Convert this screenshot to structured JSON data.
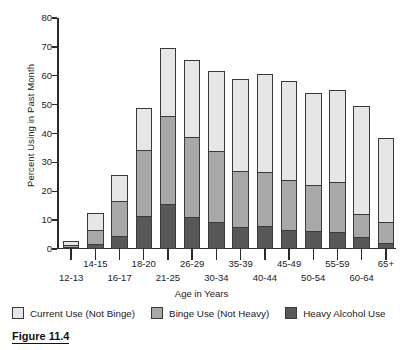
{
  "caption": "Figure 11.4",
  "chart_data": {
    "type": "bar",
    "stacked": true,
    "title": "",
    "xlabel": "Age in Years",
    "ylabel": "Percent Using in Past Month",
    "ylim": [
      0,
      80
    ],
    "yticks": [
      0,
      10,
      20,
      30,
      40,
      50,
      60,
      70,
      80
    ],
    "grid": false,
    "legend_position": "bottom",
    "categories": [
      "12-13",
      "14-15",
      "16-17",
      "18-20",
      "21-25",
      "26-29",
      "30-34",
      "35-39",
      "40-44",
      "45-49",
      "50-54",
      "55-59",
      "60-64",
      "65+"
    ],
    "series": [
      {
        "name": "Heavy Alcohol Use",
        "color": "#585858",
        "values": [
          0.6,
          1.7,
          4.5,
          11.3,
          15.5,
          11.0,
          9.5,
          7.5,
          7.8,
          6.7,
          6.4,
          6.0,
          4.0,
          2.2
        ]
      },
      {
        "name": "Binge Use (Not Heavy)",
        "color": "#a8a8a8",
        "values": [
          0.9,
          5.4,
          12.5,
          23.2,
          31.0,
          28.0,
          24.7,
          19.8,
          19.3,
          17.6,
          16.2,
          17.4,
          8.5,
          7.5
        ]
      },
      {
        "name": "Current Use (Not Binge)",
        "color": "#e6e6e6",
        "values": [
          2.0,
          6.0,
          9.4,
          15.2,
          23.7,
          27.3,
          28.3,
          32.2,
          34.1,
          34.6,
          32.2,
          32.2,
          37.7,
          29.4
        ]
      }
    ],
    "totals": [
      3.5,
      13.1,
      26.4,
      49.7,
      70.2,
      66.3,
      62.5,
      59.5,
      61.2,
      58.9,
      54.8,
      55.6,
      50.2,
      39.1
    ]
  }
}
